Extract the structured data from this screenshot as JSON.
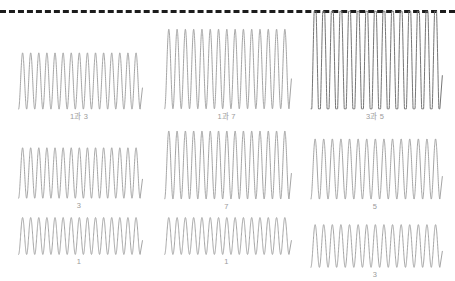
{
  "figure": {
    "background_color": "#ffffff",
    "trace_color": "#9a9a9a",
    "caption_color": "#9b9b9b",
    "reference_line": {
      "name": "dashed-reference-line",
      "color": "#1c1c1c",
      "style": "dashed",
      "thickness_px": 3,
      "y_px": 10
    }
  },
  "chart_data": {
    "type": "line",
    "title": "",
    "subtitle": "",
    "xlabel": "",
    "ylabel": "",
    "grid": false,
    "legend_position": "none",
    "layout": {
      "rows": 3,
      "cols": 3
    },
    "shared_annotation": "dashed horizontal reference line across top of figure",
    "panels": [
      {
        "id": "panel-r1c1",
        "row": 1,
        "col": 1,
        "caption": "1과 3",
        "cycles": 15,
        "amplitude": 1.0,
        "clipped": false,
        "x": [
          0,
          1
        ],
        "y_description": "sinusoidal oscillation, constant amplitude, 15 cycles"
      },
      {
        "id": "panel-r1c2",
        "row": 1,
        "col": 2,
        "caption": "1과 7",
        "cycles": 15,
        "amplitude": 1.55,
        "clipped": false,
        "x": [
          0,
          1
        ],
        "y_description": "sinusoidal oscillation, constant amplitude, 15 cycles, larger amplitude"
      },
      {
        "id": "panel-r1c3",
        "row": 1,
        "col": 3,
        "caption": "3과 5",
        "cycles": 15,
        "amplitude": 2.6,
        "clipped": true,
        "x": [
          0,
          1
        ],
        "y_description": "sinusoidal oscillation clipped/saturated at the dashed reference line, 15 cycles, flat tops"
      },
      {
        "id": "panel-r2c1",
        "row": 2,
        "col": 1,
        "caption": "3",
        "cycles": 15,
        "amplitude": 0.92,
        "clipped": false,
        "x": [
          0,
          1
        ],
        "y_description": "sinusoidal oscillation, constant amplitude, 15 cycles"
      },
      {
        "id": "panel-r2c2",
        "row": 2,
        "col": 2,
        "caption": "7",
        "cycles": 15,
        "amplitude": 1.5,
        "clipped": false,
        "x": [
          0,
          1
        ],
        "y_description": "sinusoidal oscillation, constant amplitude, 15 cycles, larger amplitude"
      },
      {
        "id": "panel-r2c3",
        "row": 2,
        "col": 3,
        "caption": "5",
        "cycles": 15,
        "amplitude": 1.25,
        "clipped": false,
        "x": [
          0,
          1
        ],
        "y_description": "sinusoidal oscillation, constant amplitude, 15 cycles"
      },
      {
        "id": "panel-r3c1",
        "row": 3,
        "col": 1,
        "caption": "1",
        "cycles": 15,
        "amplitude": 0.62,
        "clipped": false,
        "x": [
          0,
          1
        ],
        "y_description": "sinusoidal oscillation, constant amplitude, 15 cycles, small amplitude"
      },
      {
        "id": "panel-r3c2",
        "row": 3,
        "col": 2,
        "caption": "1",
        "cycles": 15,
        "amplitude": 0.62,
        "clipped": false,
        "x": [
          0,
          1
        ],
        "y_description": "sinusoidal oscillation, constant amplitude, 15 cycles, small amplitude"
      },
      {
        "id": "panel-r3c3",
        "row": 3,
        "col": 3,
        "caption": "3",
        "cycles": 15,
        "amplitude": 0.92,
        "clipped": false,
        "x": [
          0,
          1
        ],
        "y_description": "sinusoidal oscillation, constant amplitude, 15 cycles"
      }
    ]
  }
}
